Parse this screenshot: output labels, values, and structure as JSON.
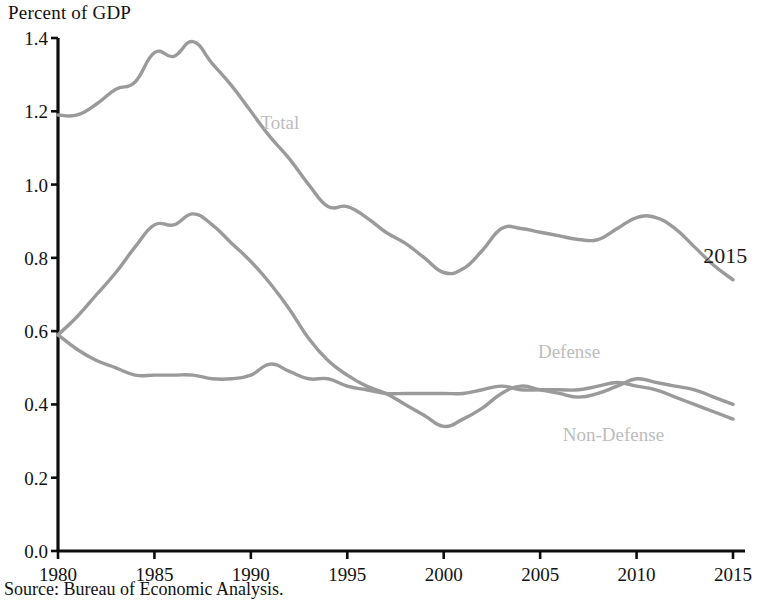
{
  "chart_data": {
    "type": "line",
    "title": "Percent of GDP",
    "xlabel": "",
    "ylabel": "Percent of GDP",
    "ylim": [
      0.0,
      1.4
    ],
    "xlim": [
      1980,
      2015
    ],
    "grid": false,
    "legend_position": "inline-annotations",
    "ytick_labels": [
      "1.4",
      "1.2",
      "1.0",
      "0.8",
      "0.6",
      "0.4",
      "0.2",
      "0.0"
    ],
    "ytick_values": [
      1.4,
      1.2,
      1.0,
      0.8,
      0.6,
      0.4,
      0.2,
      0.0
    ],
    "xtick_labels": [
      "1980",
      "1985",
      "1990",
      "1995",
      "2000",
      "2005",
      "2010",
      "2015"
    ],
    "xtick_values": [
      1980,
      1985,
      1990,
      1995,
      2000,
      2005,
      2010,
      2015
    ],
    "x": [
      1980,
      1981,
      1982,
      1983,
      1984,
      1985,
      1986,
      1987,
      1988,
      1989,
      1990,
      1991,
      1992,
      1993,
      1994,
      1995,
      1996,
      1997,
      1998,
      1999,
      2000,
      2001,
      2002,
      2003,
      2004,
      2005,
      2006,
      2007,
      2008,
      2009,
      2010,
      2011,
      2012,
      2013,
      2014,
      2015
    ],
    "series": [
      {
        "name": "Total",
        "color": "#9a9a9a",
        "label_annotation": "Total",
        "values": [
          1.19,
          1.19,
          1.22,
          1.26,
          1.28,
          1.36,
          1.35,
          1.39,
          1.33,
          1.27,
          1.2,
          1.13,
          1.07,
          1.0,
          0.94,
          0.94,
          0.91,
          0.87,
          0.84,
          0.8,
          0.76,
          0.77,
          0.82,
          0.88,
          0.88,
          0.87,
          0.86,
          0.85,
          0.85,
          0.88,
          0.91,
          0.91,
          0.88,
          0.83,
          0.78,
          0.74
        ]
      },
      {
        "name": "Defense",
        "color": "#9a9a9a",
        "label_annotation": "Defense",
        "values": [
          0.59,
          0.64,
          0.7,
          0.76,
          0.83,
          0.89,
          0.89,
          0.92,
          0.89,
          0.84,
          0.79,
          0.73,
          0.66,
          0.58,
          0.52,
          0.48,
          0.45,
          0.43,
          0.4,
          0.37,
          0.34,
          0.36,
          0.39,
          0.43,
          0.45,
          0.44,
          0.43,
          0.42,
          0.43,
          0.45,
          0.47,
          0.46,
          0.45,
          0.44,
          0.42,
          0.4
        ]
      },
      {
        "name": "Non-Defense",
        "color": "#9a9a9a",
        "label_annotation": "Non-Defense",
        "values": [
          0.59,
          0.55,
          0.52,
          0.5,
          0.48,
          0.48,
          0.48,
          0.48,
          0.47,
          0.47,
          0.48,
          0.51,
          0.49,
          0.47,
          0.47,
          0.45,
          0.44,
          0.43,
          0.43,
          0.43,
          0.43,
          0.43,
          0.44,
          0.45,
          0.44,
          0.44,
          0.44,
          0.44,
          0.45,
          0.46,
          0.45,
          0.44,
          0.42,
          0.4,
          0.38,
          0.36
        ]
      }
    ],
    "annotations": [
      {
        "text": "Total",
        "x": 1991.5,
        "y": 1.17
      },
      {
        "text": "Defense",
        "x": 2006.5,
        "y": 0.545
      },
      {
        "text": "Non-Defense",
        "x": 2008.8,
        "y": 0.318
      },
      {
        "text": "2015",
        "x": 2014.6,
        "y": 0.805
      }
    ],
    "source": "Source: Bureau of Economic Analysis."
  },
  "colors": {
    "line": "#9a9a9a",
    "axis": "#0d0d0d",
    "annotation_light": "#bcbcbc",
    "annotation_dark": "#1a1a1a",
    "background": "#ffffff"
  }
}
